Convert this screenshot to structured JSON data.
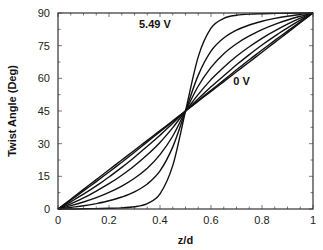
{
  "chart_data": {
    "type": "line",
    "title": "",
    "xlabel": "z/d",
    "ylabel": "Twist Angle (Deg)",
    "xlim": [
      0,
      1
    ],
    "ylim": [
      0,
      90
    ],
    "xticks": [
      0,
      0.2,
      0.4,
      0.6,
      0.8,
      1
    ],
    "xtick_labels": [
      "0",
      "0.2",
      "0.4",
      "0.6",
      "0.8",
      "1"
    ],
    "yticks": [
      0,
      15,
      30,
      45,
      60,
      75,
      90
    ],
    "ytick_labels": [
      "0",
      "15",
      "30",
      "45",
      "60",
      "75",
      "90"
    ],
    "grid": false,
    "legend": null,
    "annotations": [
      {
        "text": "5.49 V",
        "x": 0.38,
        "y": 83
      },
      {
        "text": "0 V",
        "x": 0.72,
        "y": 57
      }
    ],
    "x": [
      0,
      0.05,
      0.1,
      0.15,
      0.2,
      0.25,
      0.3,
      0.35,
      0.4,
      0.45,
      0.5,
      0.55,
      0.6,
      0.65,
      0.7,
      0.75,
      0.8,
      0.85,
      0.9,
      0.95,
      1
    ],
    "series": [
      {
        "name": "0 V",
        "values": [
          0,
          4.5,
          9,
          13.5,
          18,
          22.5,
          27,
          31.5,
          36,
          40.5,
          45,
          49.5,
          54,
          58.5,
          63,
          67.5,
          72,
          76.5,
          81,
          85.5,
          90
        ]
      },
      {
        "name": "V2",
        "values": [
          0,
          4.1,
          8.3,
          12.6,
          17,
          21.5,
          26.1,
          30.8,
          35.5,
          40.2,
          45,
          49.8,
          54.5,
          59.2,
          63.9,
          68.5,
          73,
          77.4,
          81.7,
          85.9,
          90
        ]
      },
      {
        "name": "V3",
        "values": [
          0,
          3.3,
          6.8,
          10.6,
          14.7,
          19.1,
          23.8,
          28.8,
          33.9,
          39.4,
          45,
          50.6,
          56.1,
          61.2,
          66.2,
          70.9,
          75.3,
          79.4,
          83.2,
          86.7,
          90
        ]
      },
      {
        "name": "V4",
        "values": [
          0,
          2.4,
          5.1,
          8.2,
          11.6,
          15.5,
          19.9,
          24.9,
          30.6,
          37.4,
          45,
          52.6,
          59.4,
          65.1,
          70.1,
          74.5,
          78.4,
          81.8,
          84.9,
          87.6,
          90
        ]
      },
      {
        "name": "V5",
        "values": [
          0,
          1.5,
          3.2,
          5.2,
          7.6,
          10.5,
          14.1,
          18.7,
          25,
          33.5,
          45,
          56.5,
          65,
          71.3,
          75.9,
          79.5,
          82.4,
          84.8,
          86.8,
          88.5,
          90
        ]
      },
      {
        "name": "V6",
        "values": [
          0,
          0.7,
          1.5,
          2.5,
          3.8,
          5.5,
          7.9,
          11.5,
          17.5,
          28.5,
          45,
          61.5,
          72.5,
          78.5,
          82.1,
          84.5,
          86.2,
          87.5,
          88.5,
          89.3,
          90
        ]
      },
      {
        "name": "5.49 V",
        "values": [
          0,
          0,
          0.1,
          0.2,
          0.3,
          0.5,
          1,
          2.5,
          7,
          20,
          45,
          70,
          83,
          87.5,
          89,
          89.5,
          89.7,
          89.8,
          89.9,
          90,
          90
        ]
      }
    ]
  }
}
